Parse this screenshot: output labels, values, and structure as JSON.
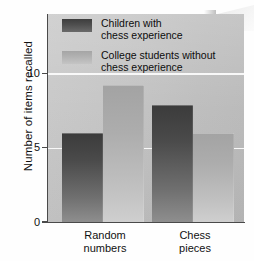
{
  "chart_data": {
    "type": "bar",
    "title": "",
    "subtitle": "",
    "xlabel": "",
    "ylabel": "Number of items recalled",
    "ylim": [
      0,
      14
    ],
    "yticks": [
      0,
      5,
      10
    ],
    "ytick_labels": [
      "0",
      "5",
      "10"
    ],
    "grid": true,
    "gridlines_at": [
      5,
      10
    ],
    "legend_position": "inside-top-left",
    "categories": [
      "Random numbers",
      "Chess pieces"
    ],
    "category_lines": [
      [
        "Random",
        "numbers"
      ],
      [
        "Chess",
        "pieces"
      ]
    ],
    "series": [
      {
        "name": "Children with chess experience",
        "name_lines": [
          "Children with",
          "chess experience"
        ],
        "color": "#4a4a4a",
        "values": [
          6.0,
          7.9
        ]
      },
      {
        "name": "College students without chess experience",
        "name_lines": [
          "College students without",
          "chess experience"
        ],
        "color": "#b2b2b2",
        "values": [
          9.2,
          6.0
        ]
      }
    ]
  },
  "axis": {
    "y_title": "Number of items recalled",
    "y_tick_0": "0",
    "y_tick_5": "5",
    "y_tick_10": "10",
    "x_cat_0_line_1": "Random",
    "x_cat_0_line_2": "numbers",
    "x_cat_1_line_1": "Chess",
    "x_cat_1_line_2": "pieces"
  },
  "legend": {
    "item_0_line_1": "Children with",
    "item_0_line_2": "chess experience",
    "item_1_line_1": "College students without",
    "item_1_line_2": "chess experience"
  },
  "colors": {
    "series_dark": "#4a4a4a",
    "series_light": "#b2b2b2",
    "plot_background": "#c4c4c4",
    "gridline": "#fbfbfb",
    "axis": "#4a4a4a",
    "page_background": "#ffffff"
  }
}
